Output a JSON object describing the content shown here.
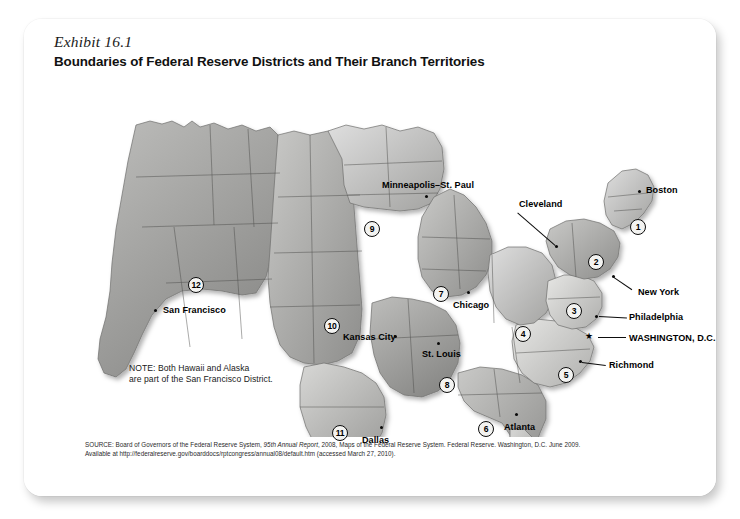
{
  "exhibit": {
    "label": "Exhibit 16.1",
    "title": "Boundaries of Federal Reserve Districts and Their Branch Territories"
  },
  "map": {
    "note": "NOTE: Both Hawaii and Alaska\nare part of the San Francisco District.",
    "cities": [
      {
        "name": "Minneapolis–St. Paul",
        "label_x": 340,
        "label_y": 106,
        "dot_x": 383,
        "dot_y": 118,
        "anchor": "left"
      },
      {
        "name": "Cleveland",
        "label_x": 479,
        "label_y": 126,
        "dot_x": 513,
        "dot_y": 168,
        "anchor": "left"
      },
      {
        "name": "Boston",
        "label_x": 605,
        "label_y": 110,
        "dot_x": 596,
        "dot_y": 113,
        "anchor": "left"
      },
      {
        "name": "New York",
        "label_x": 587,
        "label_y": 194,
        "dot_x": 570,
        "dot_y": 213,
        "anchor": "left"
      },
      {
        "name": "Philadelphia",
        "label_x": 572,
        "label_y": 239,
        "dot_x": 555,
        "dot_y": 238,
        "anchor": "left"
      },
      {
        "name": "WASHINGTON, D.C.",
        "label_x": 572,
        "label_y": 261,
        "dot_x": 546,
        "dot_y": 258,
        "anchor": "left"
      },
      {
        "name": "Richmond",
        "label_x": 561,
        "label_y": 287,
        "dot_x": 537,
        "dot_y": 283,
        "anchor": "left"
      },
      {
        "name": "Chicago",
        "label_x": 411,
        "label_y": 226,
        "dot_x": 425,
        "dot_y": 217,
        "anchor": "left"
      },
      {
        "name": "St. Louis",
        "label_x": 383,
        "label_y": 273,
        "dot_x": 395,
        "dot_y": 265,
        "anchor": "left"
      },
      {
        "name": "Kansas City",
        "label_x": 303,
        "label_y": 260,
        "dot_x": 352,
        "dot_y": 259,
        "anchor": "left"
      },
      {
        "name": "San Francisco",
        "label_x": 122,
        "label_y": 231,
        "dot_x": 114,
        "dot_y": 234,
        "anchor": "left"
      },
      {
        "name": "Dallas",
        "label_x": 320,
        "label_y": 363,
        "dot_x": 338,
        "dot_y": 350,
        "anchor": "left"
      },
      {
        "name": "Atlanta",
        "label_x": 462,
        "label_y": 348,
        "dot_x": 473,
        "dot_y": 338,
        "anchor": "left"
      }
    ],
    "districts": [
      {
        "number": "1",
        "x": 596,
        "y": 150
      },
      {
        "number": "2",
        "x": 554,
        "y": 185
      },
      {
        "number": "3",
        "x": 532,
        "y": 234
      },
      {
        "number": "4",
        "x": 481,
        "y": 257
      },
      {
        "number": "5",
        "x": 524,
        "y": 298
      },
      {
        "number": "6",
        "x": 444,
        "y": 352
      },
      {
        "number": "7",
        "x": 399,
        "y": 217
      },
      {
        "number": "8",
        "x": 405,
        "y": 308
      },
      {
        "number": "9",
        "x": 330,
        "y": 152
      },
      {
        "number": "10",
        "x": 290,
        "y": 249
      },
      {
        "number": "11",
        "x": 298,
        "y": 356
      },
      {
        "number": "12",
        "x": 154,
        "y": 208
      }
    ],
    "washington_star": true
  },
  "source": {
    "line1_a": "SOURCE: Board of Governors of the Federal Reserve System, ",
    "line1_italic": "95th Annual Report",
    "line1_b": ", 2008, Maps of the Federal Reserve System. Federal Reserve. Washington, D.C. June 2009.",
    "line2": "Available at http://federalreserve.gov/boarddocs/rptcongress/annual08/default.htm (accessed March 27, 2010)."
  },
  "colors": {
    "card_bg": "#ffffff",
    "page_bg": "#ffffff",
    "map_light": "#d7d7d5",
    "map_mid": "#a8a8a6",
    "map_dark": "#7a7a78",
    "ink": "#000000"
  }
}
